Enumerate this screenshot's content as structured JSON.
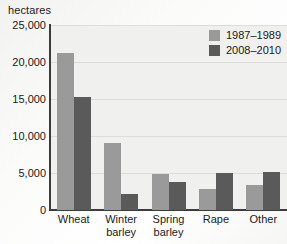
{
  "chart_data": {
    "type": "bar",
    "title": "",
    "subtitle": "",
    "xlabel": "",
    "ylabel": "hectares",
    "unit_caption": "hectares",
    "categories": [
      "Wheat",
      "Winter barley",
      "Spring barley",
      "Rape",
      "Other"
    ],
    "category_lines": [
      [
        "Wheat"
      ],
      [
        "Winter",
        "barley"
      ],
      [
        "Spring",
        "barley"
      ],
      [
        "Rape"
      ],
      [
        "Other"
      ]
    ],
    "series": [
      {
        "name": "1987–1989",
        "color": "#9a9a9a",
        "values": [
          21200,
          9100,
          4800,
          2800,
          3400
        ]
      },
      {
        "name": "2008–2010",
        "color": "#5a5a5a",
        "values": [
          15300,
          2200,
          3800,
          5000,
          5200
        ]
      }
    ],
    "ylim": [
      0,
      25000
    ],
    "yticks": [
      0,
      5000,
      10000,
      15000,
      20000,
      25000
    ],
    "ytick_labels": [
      "0",
      "5,000",
      "10,000",
      "15,000",
      "20,000",
      "25,000"
    ],
    "grid": true,
    "grid_axis": "y",
    "legend_position": "top-right",
    "legend": [
      "1987–1989",
      "2008–2010"
    ]
  },
  "colors": {
    "series_light": "#9a9a9a",
    "series_dark": "#5a5a5a",
    "plot_background": "#f0f0ee",
    "gridline": "#dcdcd8",
    "axis": "#3c3c3c",
    "text": "#1a1a1a"
  }
}
